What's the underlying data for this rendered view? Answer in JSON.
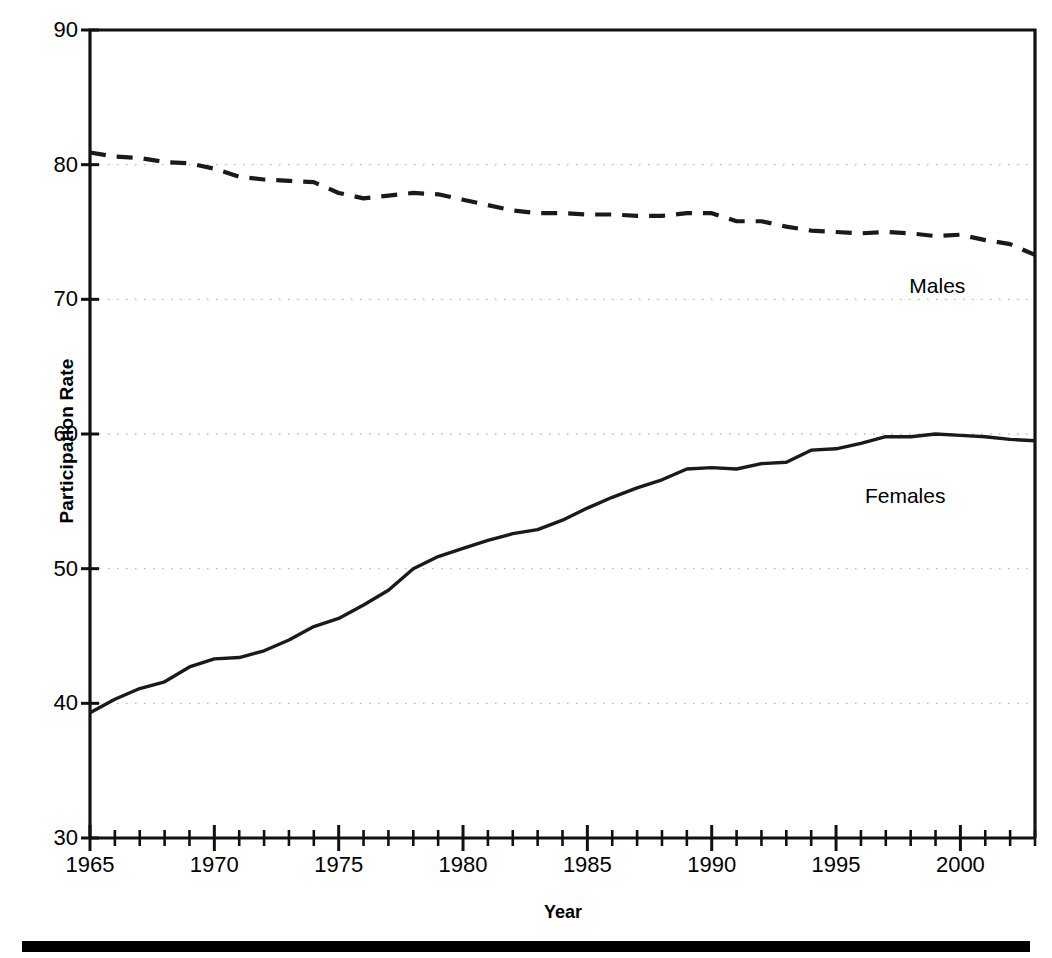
{
  "chart_data": {
    "type": "line",
    "title": "",
    "xlabel": "Year",
    "ylabel": "Participation Rate",
    "xlim": [
      1965,
      2003
    ],
    "ylim": [
      30,
      90
    ],
    "grid": true,
    "gridlines_y": [
      40,
      50,
      60,
      70,
      80
    ],
    "y_ticks": [
      30,
      40,
      50,
      60,
      70,
      80,
      90
    ],
    "y_tick_labels": [
      "30",
      "40",
      "50",
      "60",
      "70",
      "80",
      "90"
    ],
    "x_ticks": [
      1965,
      1970,
      1975,
      1980,
      1985,
      1990,
      1995,
      2000
    ],
    "x_tick_labels": [
      "1965",
      "1970",
      "1975",
      "1980",
      "1985",
      "1990",
      "1995",
      "2000"
    ],
    "x_minor_ticks_every": 1,
    "legend_position": "inline-annotation",
    "x": [
      1965,
      1966,
      1967,
      1968,
      1969,
      1970,
      1971,
      1972,
      1973,
      1974,
      1975,
      1976,
      1977,
      1978,
      1979,
      1980,
      1981,
      1982,
      1983,
      1984,
      1985,
      1986,
      1987,
      1988,
      1989,
      1990,
      1991,
      1992,
      1993,
      1994,
      1995,
      1996,
      1997,
      1998,
      1999,
      2000,
      2001,
      2002,
      2003
    ],
    "series": [
      {
        "name": "Males",
        "label": "Males",
        "style": "dashed",
        "color": "#1a1a1a",
        "values": [
          80.9,
          80.6,
          80.5,
          80.2,
          80.1,
          79.7,
          79.1,
          78.9,
          78.8,
          78.7,
          77.9,
          77.5,
          77.7,
          77.9,
          77.8,
          77.4,
          77.0,
          76.6,
          76.4,
          76.4,
          76.3,
          76.3,
          76.2,
          76.2,
          76.4,
          76.4,
          75.8,
          75.8,
          75.4,
          75.1,
          75.0,
          74.9,
          75.0,
          74.9,
          74.7,
          74.8,
          74.4,
          74.1,
          73.3
        ]
      },
      {
        "name": "Females",
        "label": "Females",
        "style": "solid",
        "color": "#1a1a1a",
        "values": [
          39.3,
          40.3,
          41.1,
          41.6,
          42.7,
          43.3,
          43.4,
          43.9,
          44.7,
          45.7,
          46.3,
          47.3,
          48.4,
          50.0,
          50.9,
          51.5,
          52.1,
          52.6,
          52.9,
          53.6,
          54.5,
          55.3,
          56.0,
          56.6,
          57.4,
          57.5,
          57.4,
          57.8,
          57.9,
          58.8,
          58.9,
          59.3,
          59.8,
          59.8,
          60.0,
          59.9,
          59.8,
          59.6,
          59.5
        ]
      }
    ],
    "annotations": [
      {
        "text": "Males",
        "x": 2000.2,
        "y": 71.0
      },
      {
        "text": "Females",
        "x": 1999.4,
        "y": 55.4
      }
    ]
  }
}
